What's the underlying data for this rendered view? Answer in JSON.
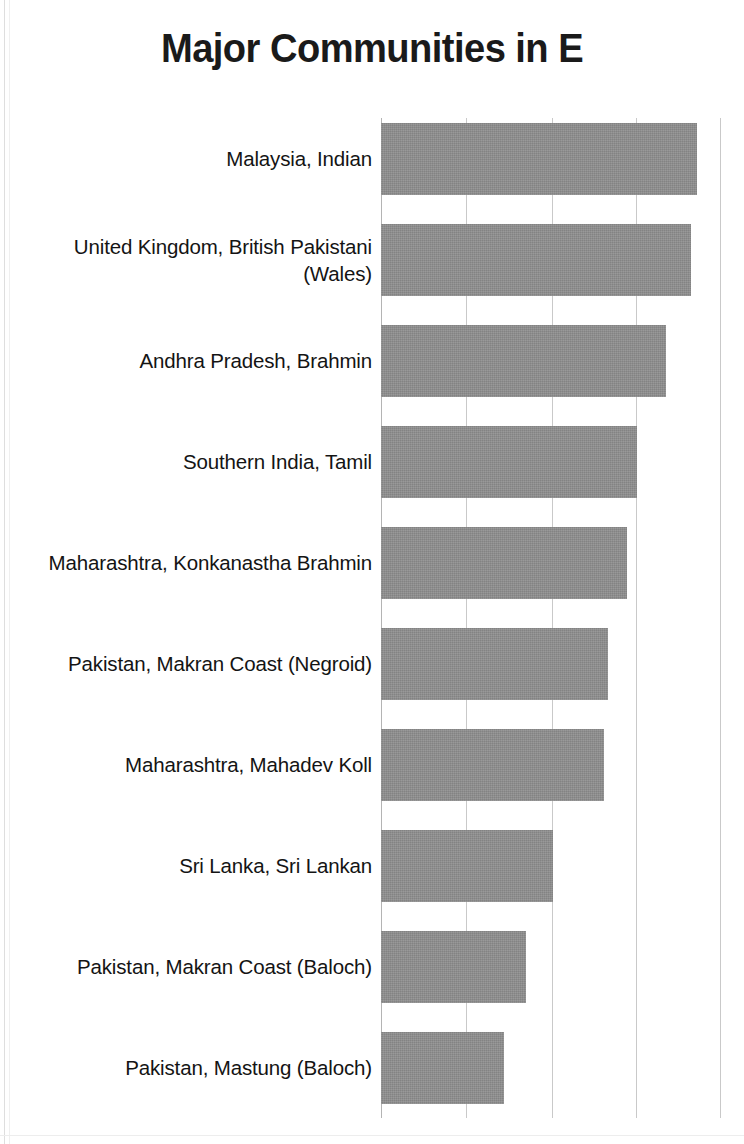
{
  "chart_data": {
    "type": "bar",
    "orientation": "horizontal",
    "title": "Major Communities in E",
    "xlabel": "",
    "ylabel": "",
    "grid": true,
    "legend": false,
    "xtick_labels": [],
    "gridline_positions_px": [
      381,
      466,
      552,
      636,
      720
    ],
    "axis_unit_px": 84.7,
    "xlim": [
      0,
      4
    ],
    "categories": [
      "Malaysia, Indian",
      "United Kingdom, British Pakistani (Wales)",
      "Andhra Pradesh, Brahmin",
      "Southern India, Tamil",
      "Maharashtra, Konkanastha Brahmin",
      "Pakistan, Makran Coast (Negroid)",
      "Maharashtra, Mahadev Koll",
      "Sri Lanka, Sri Lankan",
      "Pakistan, Makran Coast (Baloch)",
      "Pakistan, Mastung (Baloch)"
    ],
    "values": [
      3.73,
      3.66,
      3.37,
      3.02,
      2.9,
      2.68,
      2.63,
      2.03,
      1.71,
      1.45
    ],
    "bar_right_edges_px": [
      697,
      691,
      666,
      637,
      627,
      608,
      604,
      553,
      526,
      504
    ],
    "bar_color": "#8d8d8d",
    "grid_color": "#c9c9c9",
    "title_color": "#1a1a1a",
    "label_color": "#141414",
    "background": "#ffffff"
  }
}
